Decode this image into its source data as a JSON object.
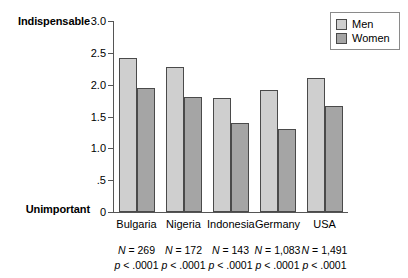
{
  "chart_data": {
    "type": "bar",
    "title": "",
    "xlabel": "",
    "ylabel": "",
    "ylim": [
      0,
      3.0
    ],
    "grid": false,
    "legend_position": "top-right",
    "categories": [
      "Bulgaria",
      "Nigeria",
      "Indonesia",
      "Germany",
      "USA"
    ],
    "series": [
      {
        "name": "Men",
        "color": "#cfcfcf",
        "values": [
          2.42,
          2.27,
          1.79,
          1.92,
          2.11
        ]
      },
      {
        "name": "Women",
        "color": "#a5a5a5",
        "values": [
          1.95,
          1.8,
          1.4,
          1.31,
          1.66
        ]
      }
    ],
    "ytick_labels": [
      "0",
      ".5",
      "1.0",
      "1.5",
      "2.0",
      "2.5",
      "3.0"
    ],
    "ytick_values": [
      0,
      0.5,
      1.0,
      1.5,
      2.0,
      2.5,
      3.0
    ],
    "axis_anchor_high": "Indispensable",
    "axis_anchor_low": "Unimportant",
    "annotations": [
      {
        "category": "Bulgaria",
        "n": "N = 269",
        "p": "p < .0001"
      },
      {
        "category": "Nigeria",
        "n": "N = 172",
        "p": "p < .0001"
      },
      {
        "category": "Indonesia",
        "n": "N = 143",
        "p": "p < .0001"
      },
      {
        "category": "Germany",
        "n": "N = 1,083",
        "p": "p < .0001"
      },
      {
        "category": "USA",
        "n": "N = 1,491",
        "p": "p < .0001"
      }
    ]
  },
  "legend": {
    "items": [
      {
        "label": "Men"
      },
      {
        "label": "Women"
      }
    ]
  },
  "colors": {
    "men_bar": "#cfcfcf",
    "women_bar": "#a5a5a5",
    "bar_outline": "#4a4a4a",
    "axis": "#555555",
    "background": "#ffffff"
  }
}
